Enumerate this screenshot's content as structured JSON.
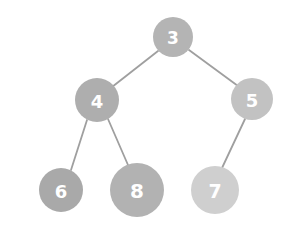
{
  "diagram": {
    "type": "binary-tree",
    "background_color": "#ffffff",
    "edge_color": "#9f9f9f",
    "label_color": "#ffffff",
    "nodes": [
      {
        "id": "n3",
        "label": "3",
        "cx": 173,
        "cy": 37,
        "r": 20,
        "fill": "#b4b4b4",
        "font_size": 17
      },
      {
        "id": "n4",
        "label": "4",
        "cx": 97,
        "cy": 100,
        "r": 22,
        "fill": "#aeaeae",
        "font_size": 18
      },
      {
        "id": "n5",
        "label": "5",
        "cx": 252,
        "cy": 99,
        "r": 21,
        "fill": "#c2c2c2",
        "font_size": 18
      },
      {
        "id": "n6",
        "label": "6",
        "cx": 61,
        "cy": 190,
        "r": 22,
        "fill": "#a9a9a9",
        "font_size": 18
      },
      {
        "id": "n8",
        "label": "8",
        "cx": 137,
        "cy": 190,
        "r": 27,
        "fill": "#b2b2b2",
        "font_size": 20
      },
      {
        "id": "n7",
        "label": "7",
        "cx": 215,
        "cy": 190,
        "r": 24,
        "fill": "#cfcfcf",
        "font_size": 19
      }
    ],
    "edges": [
      {
        "id": "e3-4",
        "from": "n3",
        "to": "n4",
        "x1": 158,
        "y1": 51,
        "x2": 112,
        "y2": 87
      },
      {
        "id": "e3-5",
        "from": "n3",
        "to": "n5",
        "x1": 189,
        "y1": 50,
        "x2": 238,
        "y2": 86
      },
      {
        "id": "e4-6",
        "from": "n4",
        "to": "n6",
        "x1": 87,
        "y1": 120,
        "x2": 71,
        "y2": 170
      },
      {
        "id": "e4-8",
        "from": "n4",
        "to": "n8",
        "x1": 108,
        "y1": 119,
        "x2": 128,
        "y2": 165
      },
      {
        "id": "e5-7",
        "from": "n5",
        "to": "n7",
        "x1": 245,
        "y1": 119,
        "x2": 222,
        "y2": 168
      }
    ]
  }
}
